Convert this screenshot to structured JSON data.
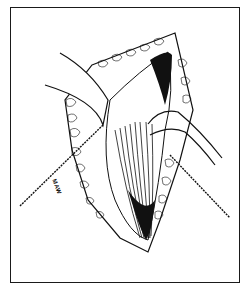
{
  "illustration": {
    "subject": "surgical-incision-drawing",
    "signature": "MAW",
    "colors": {
      "ink": "#111111",
      "paper": "#ffffff",
      "border": "#1a1a1a"
    }
  }
}
